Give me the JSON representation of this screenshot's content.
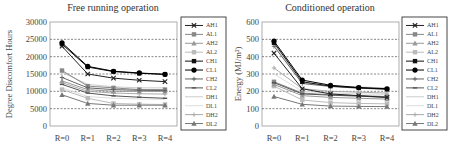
{
  "chart_data": [
    {
      "type": "line",
      "title": "Free running operation",
      "xlabel": "",
      "ylabel": "Degree Discomfort Hours",
      "ylim": [
        0,
        30000
      ],
      "yticks": [
        "0",
        "5000",
        "10000",
        "15000",
        "20000",
        "25000",
        "30000"
      ],
      "categories": [
        "R=0",
        "R=1",
        "R=2",
        "R=3",
        "R=4"
      ],
      "grid": "horizontal dashed",
      "legend_position": "right",
      "series": [
        {
          "name": "AH1",
          "values": [
            23000,
            15000,
            13800,
            13200,
            12800
          ],
          "color": "#222222",
          "marker": "x"
        },
        {
          "name": "AL1",
          "values": [
            16000,
            11500,
            11000,
            10500,
            10500
          ],
          "color": "#888888",
          "marker": "square"
        },
        {
          "name": "AH2",
          "values": [
            13000,
            10500,
            10000,
            10000,
            10000
          ],
          "color": "#999999",
          "marker": "triangle"
        },
        {
          "name": "AL2",
          "values": [
            10500,
            8000,
            6500,
            6300,
            6200
          ],
          "color": "#bbbbbb",
          "marker": "square"
        },
        {
          "name": "CH1",
          "values": [
            23600,
            17000,
            15700,
            15200,
            14900
          ],
          "color": "#111111",
          "marker": "square"
        },
        {
          "name": "CL1",
          "values": [
            24000,
            17200,
            15800,
            15300,
            14900
          ],
          "color": "#000000",
          "marker": "circle"
        },
        {
          "name": "CH2",
          "values": [
            14000,
            11000,
            10500,
            10300,
            10200
          ],
          "color": "#666666",
          "marker": "plus"
        },
        {
          "name": "CL2",
          "values": [
            12000,
            9500,
            8700,
            8300,
            8000
          ],
          "color": "#555555",
          "marker": "dash"
        },
        {
          "name": "DH1",
          "values": [
            15500,
            12000,
            11300,
            11000,
            11000
          ],
          "color": "#cccccc",
          "marker": "none"
        },
        {
          "name": "DL1",
          "values": [
            11000,
            8500,
            8000,
            7800,
            7700
          ],
          "color": "#dddddd",
          "marker": "none"
        },
        {
          "name": "DH2",
          "values": [
            12500,
            10000,
            9500,
            9300,
            9200
          ],
          "color": "#aaaaaa",
          "marker": "plus"
        },
        {
          "name": "DL2",
          "values": [
            9000,
            6500,
            6000,
            6000,
            6000
          ],
          "color": "#777777",
          "marker": "triangle"
        }
      ]
    },
    {
      "type": "line",
      "title": "Conditioned operation",
      "xlabel": "",
      "ylabel": "Energy (MJ/m²)",
      "ylim": [
        0,
        600
      ],
      "yticks": [
        "0",
        "100",
        "200",
        "300",
        "400",
        "500",
        "600"
      ],
      "categories": [
        "R=0",
        "R=1",
        "R=2",
        "R=3",
        "R=4"
      ],
      "grid": "horizontal dashed",
      "legend_position": "right",
      "series": [
        {
          "name": "AH1",
          "values": [
            420,
            215,
            185,
            175,
            165
          ],
          "color": "#222222",
          "marker": "x"
        },
        {
          "name": "AL1",
          "values": [
            255,
            190,
            180,
            175,
            170
          ],
          "color": "#888888",
          "marker": "square"
        },
        {
          "name": "AH2",
          "values": [
            240,
            175,
            165,
            160,
            155
          ],
          "color": "#999999",
          "marker": "triangle"
        },
        {
          "name": "AL2",
          "values": [
            230,
            150,
            135,
            130,
            128
          ],
          "color": "#bbbbbb",
          "marker": "square"
        },
        {
          "name": "CH1",
          "values": [
            480,
            255,
            230,
            220,
            213
          ],
          "color": "#111111",
          "marker": "square"
        },
        {
          "name": "CL1",
          "values": [
            490,
            265,
            235,
            222,
            215
          ],
          "color": "#000000",
          "marker": "circle"
        },
        {
          "name": "CH2",
          "values": [
            460,
            245,
            228,
            218,
            212
          ],
          "color": "#666666",
          "marker": "plus"
        },
        {
          "name": "CL2",
          "values": [
            250,
            185,
            178,
            172,
            165
          ],
          "color": "#555555",
          "marker": "dash"
        },
        {
          "name": "DH1",
          "values": [
            470,
            250,
            232,
            225,
            220
          ],
          "color": "#cccccc",
          "marker": "none"
        },
        {
          "name": "DL1",
          "values": [
            300,
            200,
            190,
            185,
            182
          ],
          "color": "#dddddd",
          "marker": "none"
        },
        {
          "name": "DH2",
          "values": [
            335,
            215,
            200,
            195,
            190
          ],
          "color": "#aaaaaa",
          "marker": "plus"
        },
        {
          "name": "DL2",
          "values": [
            170,
            125,
            115,
            113,
            112
          ],
          "color": "#777777",
          "marker": "triangle"
        }
      ]
    }
  ],
  "charts": {
    "left": {
      "title": "Free running operation",
      "ylabel": "Degree Discomfort Hours"
    },
    "right": {
      "title": "Conditioned operation",
      "ylabel": "Energy (MJ/m²)"
    }
  }
}
